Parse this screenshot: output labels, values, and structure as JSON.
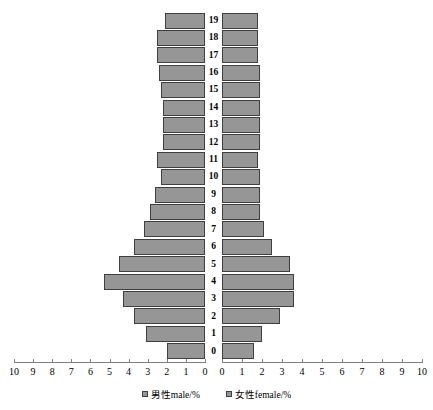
{
  "chart_data": {
    "type": "bar",
    "subtype": "population-pyramid",
    "title": "",
    "xlabel": "",
    "ylabel": "",
    "categories": [
      "0",
      "1",
      "2",
      "3",
      "4",
      "5",
      "6",
      "7",
      "8",
      "9",
      "10",
      "11",
      "12",
      "13",
      "14",
      "15",
      "16",
      "17",
      "18",
      "19"
    ],
    "xlim_left": [
      10,
      0
    ],
    "xlim_right": [
      0,
      10
    ],
    "ylim": [
      0,
      19
    ],
    "grid": false,
    "legend_position": "bottom-center",
    "series": [
      {
        "name": "男性male/%",
        "side": "left",
        "color": "#969696",
        "values": [
          2.0,
          3.1,
          3.7,
          4.3,
          5.3,
          4.5,
          3.7,
          3.2,
          2.9,
          2.6,
          2.3,
          2.5,
          2.2,
          2.2,
          2.2,
          2.3,
          2.4,
          2.5,
          2.5,
          2.1
        ]
      },
      {
        "name": "女性female/%",
        "side": "right",
        "color": "#969696",
        "values": [
          1.6,
          2.0,
          2.9,
          3.6,
          3.6,
          3.4,
          2.5,
          2.1,
          1.9,
          1.9,
          1.9,
          1.8,
          1.9,
          1.9,
          1.9,
          1.9,
          1.9,
          1.8,
          1.8,
          1.8
        ]
      }
    ],
    "xticks_left": [
      "10",
      "9",
      "8",
      "7",
      "6",
      "5",
      "4",
      "3",
      "2",
      "1",
      "0"
    ],
    "xticks_right": [
      "0",
      "1",
      "2",
      "3",
      "4",
      "5",
      "6",
      "7",
      "8",
      "9",
      "10"
    ]
  },
  "legend": {
    "male": "男性male/%",
    "female": "女性female/%"
  }
}
